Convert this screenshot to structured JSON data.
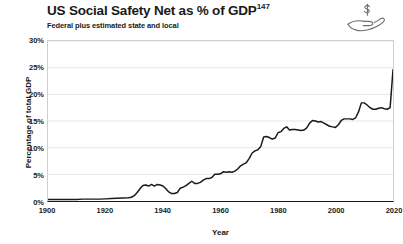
{
  "header": {
    "title": "US Social Safety Net as % of GDP",
    "title_superscript": "147",
    "subtitle": "Federal plus estimated state and local",
    "icon": "hand-with-dollar-icon"
  },
  "colors": {
    "line": "#1a1a1a",
    "grid": "#e6e6e6",
    "frame": "#cfcfcf",
    "axis": "#1a1a1a",
    "background": "#ffffff"
  },
  "chart_data": {
    "type": "line",
    "title": "US Social Safety Net as % of GDP",
    "subtitle": "Federal plus estimated state and local",
    "xlabel": "Year",
    "ylabel": "Percentage of total GDP",
    "xlim": [
      1900,
      2020
    ],
    "ylim": [
      0,
      30
    ],
    "xticks": [
      1900,
      1920,
      1940,
      1960,
      1980,
      2000,
      2020
    ],
    "xtick_labels": [
      "1900",
      "1920",
      "1940",
      "1960",
      "1980",
      "2000",
      "2020"
    ],
    "xminor_step": 5,
    "yticks": [
      0,
      5,
      10,
      15,
      20,
      25,
      30
    ],
    "ytick_labels": [
      "0%",
      "5%",
      "10%",
      "15%",
      "20%",
      "25%",
      "30%"
    ],
    "grid": "horizontal",
    "legend": "none",
    "series": [
      {
        "name": "Social safety net spending (% of GDP)",
        "x": [
          1900,
          1902,
          1904,
          1906,
          1908,
          1910,
          1912,
          1914,
          1916,
          1918,
          1920,
          1922,
          1924,
          1926,
          1928,
          1929,
          1930,
          1931,
          1932,
          1933,
          1934,
          1935,
          1936,
          1937,
          1938,
          1939,
          1940,
          1941,
          1942,
          1943,
          1944,
          1945,
          1946,
          1947,
          1948,
          1949,
          1950,
          1951,
          1952,
          1953,
          1954,
          1955,
          1956,
          1957,
          1958,
          1959,
          1960,
          1961,
          1962,
          1963,
          1964,
          1965,
          1966,
          1967,
          1968,
          1969,
          1970,
          1971,
          1972,
          1973,
          1974,
          1975,
          1976,
          1977,
          1978,
          1979,
          1980,
          1981,
          1982,
          1983,
          1984,
          1985,
          1986,
          1987,
          1988,
          1989,
          1990,
          1991,
          1992,
          1993,
          1994,
          1995,
          1996,
          1997,
          1998,
          1999,
          2000,
          2001,
          2002,
          2003,
          2004,
          2005,
          2006,
          2007,
          2008,
          2009,
          2010,
          2011,
          2012,
          2013,
          2014,
          2015,
          2016,
          2017,
          2018,
          2019,
          2020
        ],
        "values": [
          0.3,
          0.3,
          0.3,
          0.3,
          0.3,
          0.3,
          0.35,
          0.35,
          0.35,
          0.35,
          0.4,
          0.45,
          0.5,
          0.55,
          0.6,
          0.7,
          1.0,
          1.6,
          2.3,
          2.9,
          3.0,
          2.8,
          3.1,
          2.8,
          3.1,
          3.0,
          2.8,
          2.3,
          1.7,
          1.4,
          1.4,
          1.6,
          2.4,
          2.6,
          2.9,
          3.3,
          3.7,
          3.3,
          3.3,
          3.5,
          3.9,
          4.2,
          4.2,
          4.4,
          5.0,
          5.0,
          5.1,
          5.5,
          5.4,
          5.5,
          5.4,
          5.6,
          6.0,
          6.6,
          6.9,
          7.2,
          8.0,
          9.0,
          9.4,
          9.6,
          10.2,
          12.0,
          12.1,
          11.9,
          11.6,
          11.8,
          12.8,
          13.0,
          13.6,
          13.9,
          13.3,
          13.4,
          13.4,
          13.3,
          13.2,
          13.3,
          13.7,
          14.6,
          15.1,
          15.0,
          14.8,
          14.9,
          14.6,
          14.3,
          14.0,
          13.9,
          13.8,
          14.3,
          15.1,
          15.4,
          15.4,
          15.4,
          15.3,
          15.6,
          16.7,
          18.4,
          18.4,
          18.0,
          17.5,
          17.2,
          17.2,
          17.4,
          17.5,
          17.3,
          17.2,
          17.5,
          24.6
        ]
      }
    ],
    "annotations": [
      {
        "label": "flat near zero",
        "range": "1900-1928",
        "value_approx": 0.3
      },
      {
        "label": "New Deal rise",
        "range": "1929-1936",
        "value_approx": 3.0
      },
      {
        "label": "WWII trough",
        "range": "1943-1944",
        "value_approx": 1.4
      },
      {
        "label": "Great Society rise",
        "range": "1965-1976",
        "value_approx": 12.0
      },
      {
        "label": "plateau",
        "range": "1980-2007",
        "value_approx": 14.5
      },
      {
        "label": "Great Recession",
        "range": "2009-2010",
        "value_approx": 18.4
      },
      {
        "label": "COVID spike",
        "range": "2020",
        "value_approx": 24.6
      }
    ]
  }
}
